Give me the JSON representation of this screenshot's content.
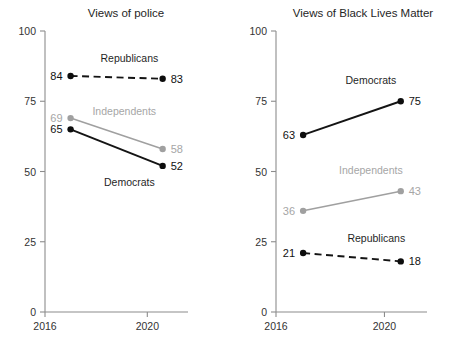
{
  "figure": {
    "background_color": "#ffffff",
    "panel_count": 2
  },
  "colors": {
    "dark_series": "#141414",
    "grey_series": "#a0a0a0",
    "axis": "#8c8c8c",
    "title_text": "#262626",
    "tick_text": "#333333"
  },
  "chart_data": [
    {
      "type": "line",
      "title": "Views of police",
      "xlabel": "",
      "ylabel": "",
      "ylim": [
        0,
        100
      ],
      "yticks": [
        0,
        25,
        50,
        75,
        100
      ],
      "ytick_labels": [
        "0",
        "25",
        "50",
        "75",
        "100"
      ],
      "xlim": [
        2016,
        2021.2
      ],
      "xticks": [
        2016,
        2020
      ],
      "xtick_labels": [
        "2016",
        "2020"
      ],
      "grid": false,
      "legend": "inline-annotation",
      "x": [
        2017,
        2020.6
      ],
      "series": [
        {
          "name": "Republicans",
          "values": [
            84,
            83
          ],
          "color": "#141414",
          "style": "dashed",
          "label_start": "84",
          "label_end": "83",
          "name_x": 2019.3,
          "name_y": 89
        },
        {
          "name": "Independents",
          "values": [
            69,
            58
          ],
          "color": "#a0a0a0",
          "style": "solid",
          "label_start": "69",
          "label_end": "58",
          "name_x": 2019.1,
          "name_y": 70
        },
        {
          "name": "Democrats",
          "values": [
            65,
            52
          ],
          "color": "#141414",
          "style": "solid",
          "label_start": "65",
          "label_end": "52",
          "name_x": 2019.3,
          "name_y": 45
        }
      ]
    },
    {
      "type": "line",
      "title": "Views of Black Lives Matter",
      "xlabel": "",
      "ylabel": "",
      "ylim": [
        0,
        100
      ],
      "yticks": [
        0,
        25,
        50,
        75,
        100
      ],
      "ytick_labels": [
        "0",
        "25",
        "50",
        "75",
        "100"
      ],
      "xlim": [
        2016,
        2021.2
      ],
      "xticks": [
        2016,
        2020
      ],
      "xtick_labels": [
        "2016",
        "2020"
      ],
      "grid": false,
      "legend": "inline-annotation",
      "x": [
        2017,
        2020.6
      ],
      "series": [
        {
          "name": "Democrats",
          "values": [
            63,
            75
          ],
          "color": "#141414",
          "style": "solid",
          "label_start": "63",
          "label_end": "75",
          "name_x": 2019.5,
          "name_y": 81
        },
        {
          "name": "Independents",
          "values": [
            36,
            43
          ],
          "color": "#a0a0a0",
          "style": "solid",
          "label_start": "36",
          "label_end": "43",
          "name_x": 2019.5,
          "name_y": 49
        },
        {
          "name": "Republicans",
          "values": [
            21,
            18
          ],
          "color": "#141414",
          "style": "dashed",
          "label_start": "21",
          "label_end": "18",
          "name_x": 2019.7,
          "name_y": 25
        }
      ]
    }
  ]
}
